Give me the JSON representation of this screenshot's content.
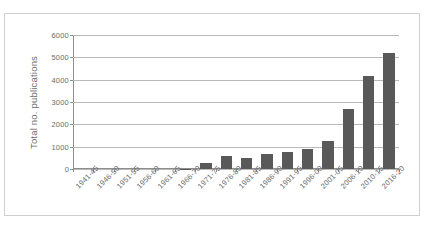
{
  "page": {
    "clipped_top_text": ""
  },
  "chart_data": {
    "type": "bar",
    "title": "",
    "xlabel": "",
    "ylabel": "Total no. publications",
    "ylim": [
      0,
      6000
    ],
    "ytick_values": [
      0,
      1000,
      2000,
      3000,
      4000,
      5000,
      6000
    ],
    "ytick_labels": [
      "0",
      "1000",
      "2000",
      "3000",
      "4000",
      "5000",
      "6000"
    ],
    "grid": true,
    "legend": "none",
    "categories": [
      "1941-45",
      "1946-50",
      "1951-55",
      "1956-60",
      "1961-65",
      "1966-70",
      "1971-75",
      "1976-80",
      "1981-85",
      "1986-90",
      "1991-95",
      "1996-00",
      "2001-05",
      "2006-10",
      "2010-15",
      "2016-20"
    ],
    "values": [
      0,
      0,
      0,
      0,
      0,
      5,
      270,
      600,
      490,
      650,
      760,
      890,
      1250,
      2690,
      4170,
      5190
    ],
    "bar_color": "#595959",
    "axis_color": "#8e8e8e",
    "gridline_color": "#b9b9b9",
    "frame_color": "#cfcfcf",
    "background_color": "#ffffff"
  }
}
